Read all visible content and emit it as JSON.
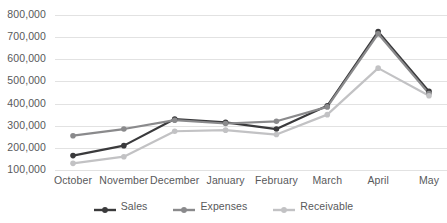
{
  "chart_data": {
    "type": "line",
    "title": "",
    "subtitle": "",
    "xlabel": "",
    "ylabel": "",
    "categories": [
      "October",
      "November",
      "December",
      "January",
      "February",
      "March",
      "April",
      "May"
    ],
    "ylim": [
      100000,
      800000
    ],
    "y_ticks": [
      "800,000",
      "700,000",
      "600,000",
      "500,000",
      "400,000",
      "300,000",
      "200,000",
      "100,000"
    ],
    "y_tick_values": [
      800000,
      700000,
      600000,
      500000,
      400000,
      300000,
      200000,
      100000
    ],
    "grid": true,
    "grid_axis": "y",
    "legend_position": "bottom",
    "series": [
      {
        "name": "Sales",
        "color": "#3a3a3c",
        "values": [
          165000,
          210000,
          330000,
          315000,
          285000,
          390000,
          725000,
          455000
        ]
      },
      {
        "name": "Expenses",
        "color": "#8a8a8c",
        "values": [
          255000,
          285000,
          325000,
          310000,
          320000,
          385000,
          715000,
          445000
        ]
      },
      {
        "name": "Receivable",
        "color": "#c2c2c4",
        "values": [
          130000,
          160000,
          275000,
          280000,
          260000,
          350000,
          560000,
          435000
        ]
      }
    ]
  },
  "colors": {
    "background": "#ffffff",
    "gridline": "#e2e2e2",
    "tick_text": "#58595b"
  }
}
